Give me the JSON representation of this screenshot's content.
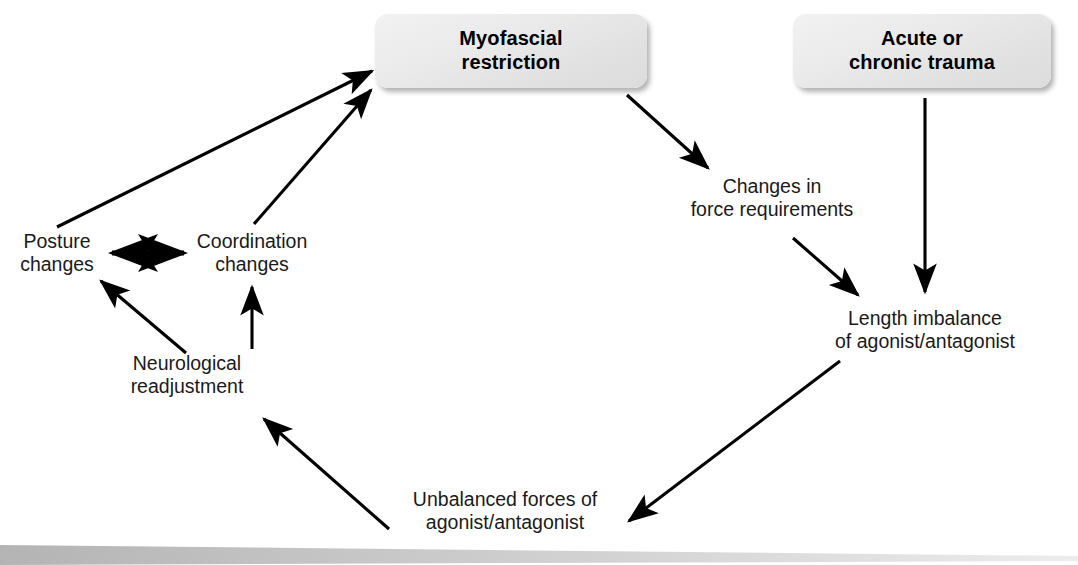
{
  "diagram": {
    "background_color": "#ffffff",
    "boxes": [
      {
        "name": "myofascial-restriction",
        "line1": "Myofascial",
        "line2": "restriction",
        "x": 375,
        "y": 14,
        "width": 272,
        "height": 74,
        "fill": "#ebebeb"
      },
      {
        "name": "acute-or-chronic-trauma",
        "line1": "Acute or",
        "line2": "chronic trauma",
        "x": 793,
        "y": 14,
        "width": 258,
        "height": 74,
        "fill": "#ebebeb"
      }
    ],
    "labels": [
      {
        "name": "posture-changes",
        "line1": "Posture",
        "line2": "changes",
        "cx": 57,
        "cy": 253
      },
      {
        "name": "coordination-changes",
        "line1": "Coordination",
        "line2": "changes",
        "cx": 252,
        "cy": 253
      },
      {
        "name": "neurological-readjustment",
        "line1": "Neurological",
        "line2": "readjustment",
        "cx": 187,
        "cy": 375
      },
      {
        "name": "changes-in-force-requirements",
        "line1": "Changes in",
        "line2": "force requirements",
        "cx": 772,
        "cy": 198
      },
      {
        "name": "length-imbalance",
        "line1": "Length imbalance",
        "line2": "of agonist/antagonist",
        "cx": 925,
        "cy": 330
      },
      {
        "name": "unbalanced-forces",
        "line1": "Unbalanced forces of",
        "line2": "agonist/antagonist",
        "cx": 505,
        "cy": 511
      }
    ],
    "arrows": [
      {
        "name": "posture-to-myofascial",
        "from": "posture-changes",
        "to": "myofascial-restriction",
        "x1": 57,
        "y1": 227,
        "x2": 372,
        "y2": 71,
        "double": false
      },
      {
        "name": "coordination-to-myofascial",
        "from": "coordination-changes",
        "to": "myofascial-restriction",
        "x1": 254,
        "y1": 224,
        "x2": 371,
        "y2": 90,
        "double": false
      },
      {
        "name": "posture-coordination-bidirectional",
        "from": "posture-changes",
        "to": "coordination-changes",
        "x1": 112,
        "y1": 253,
        "x2": 184,
        "y2": 253,
        "double": true
      },
      {
        "name": "neurological-to-posture",
        "from": "neurological-readjustment",
        "to": "posture-changes",
        "x1": 186,
        "y1": 353,
        "x2": 101,
        "y2": 281,
        "double": false
      },
      {
        "name": "neurological-to-coordination",
        "from": "neurological-readjustment",
        "to": "coordination-changes",
        "x1": 252,
        "y1": 349,
        "x2": 252,
        "y2": 287,
        "double": false
      },
      {
        "name": "myofascial-to-force-requirements",
        "from": "myofascial-restriction",
        "to": "changes-in-force-requirements",
        "x1": 627,
        "y1": 95,
        "x2": 708,
        "y2": 168,
        "double": false
      },
      {
        "name": "force-requirements-to-length-imbalance",
        "from": "changes-in-force-requirements",
        "to": "length-imbalance",
        "x1": 793,
        "y1": 238,
        "x2": 858,
        "y2": 295,
        "double": false
      },
      {
        "name": "trauma-to-length-imbalance",
        "from": "acute-or-chronic-trauma",
        "to": "length-imbalance",
        "x1": 925,
        "y1": 98,
        "x2": 925,
        "y2": 292,
        "double": false
      },
      {
        "name": "length-imbalance-to-unbalanced-forces",
        "from": "length-imbalance",
        "to": "unbalanced-forces",
        "x1": 840,
        "y1": 361,
        "x2": 629,
        "y2": 521,
        "double": false
      },
      {
        "name": "unbalanced-forces-to-neurological",
        "from": "unbalanced-forces",
        "to": "neurological-readjustment",
        "x1": 389,
        "y1": 529,
        "x2": 264,
        "y2": 419,
        "double": false
      }
    ],
    "bottom_bar": {
      "name": "bottom-divider-bar",
      "color_left": "#b6b6b6",
      "color_right": "#e8e8e8"
    }
  }
}
